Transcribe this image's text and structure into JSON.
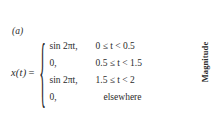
{
  "figure": {
    "label": "(a)",
    "lhs_function": "x(t)",
    "equals": "=",
    "brace_glyph": "{",
    "cases": [
      {
        "expression": "sin 2πt,",
        "condition": "0 ≤ t < 0.5",
        "condition_centered": false
      },
      {
        "expression": "0,",
        "condition": "0.5 ≤ t < 1.5",
        "condition_centered": false
      },
      {
        "expression": "sin 2πt,",
        "condition": "1.5 ≤ t < 2",
        "condition_centered": false
      },
      {
        "expression": "0,",
        "condition": "elsewhere",
        "condition_centered": true
      }
    ],
    "axis_label": "Magnitude",
    "text_color": "#2b2b2b",
    "background_color": "#ffffff"
  }
}
